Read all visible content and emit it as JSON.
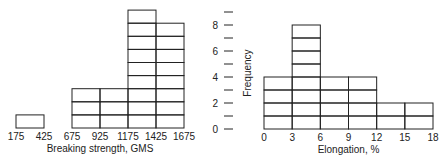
{
  "chart_data": [
    {
      "type": "bar",
      "subtype": "histogram",
      "title": "",
      "xlabel": "Breaking strength, GMS",
      "ylabel": "",
      "bin_edges": [
        175,
        425,
        675,
        925,
        1175,
        1425,
        1675
      ],
      "categories": [
        "175-425",
        "425-675",
        "675-925",
        "925-1175",
        "1175-1425",
        "1425-1675"
      ],
      "values": [
        1,
        0,
        3,
        3,
        9,
        8
      ],
      "xticks": [
        "175",
        "425",
        "675",
        "925",
        "1175",
        "1425",
        "1675"
      ],
      "ylim": [
        0,
        9
      ],
      "grid": false,
      "style": "stacked unit boxes"
    },
    {
      "type": "bar",
      "subtype": "histogram",
      "title": "",
      "xlabel": "Elongation, %",
      "ylabel": "Frequency",
      "bin_edges": [
        0,
        3,
        6,
        9,
        12,
        15,
        18
      ],
      "categories": [
        "0-3",
        "3-6",
        "6-9",
        "9-12",
        "12-15",
        "15-18"
      ],
      "values": [
        4,
        8,
        4,
        4,
        2,
        2
      ],
      "xticks": [
        "0",
        "3",
        "6",
        "9",
        "12",
        "15",
        "18"
      ],
      "yticks": [
        "0",
        "2",
        "4",
        "6",
        "8"
      ],
      "ylim": [
        0,
        9
      ],
      "grid": false,
      "style": "stacked unit boxes"
    }
  ]
}
